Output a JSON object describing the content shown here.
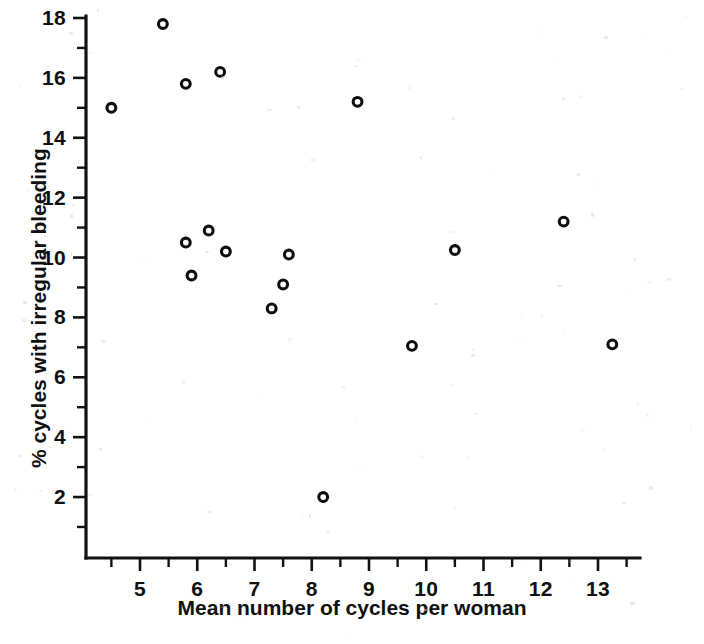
{
  "chart_data": {
    "type": "scatter",
    "title": "",
    "xlabel": "Mean number of cycles per woman",
    "ylabel": "% cycles with irregular bleeding",
    "xlim": [
      4.05,
      13.75
    ],
    "ylim": [
      0.55,
      18.4
    ],
    "xticks": [
      5,
      6,
      7,
      8,
      9,
      10,
      11,
      12,
      13
    ],
    "xtick_labels": [
      "5",
      "6",
      "7",
      "8",
      "9",
      "10",
      "11",
      "12",
      "13"
    ],
    "yticks": [
      2,
      4,
      6,
      8,
      10,
      12,
      14,
      16,
      18
    ],
    "ytick_labels": [
      "2",
      "4",
      "6",
      "8",
      "10",
      "12",
      "14",
      "16",
      "18"
    ],
    "x_minor_ticks": [
      4.5,
      5.5,
      6.5,
      7.5,
      8.5,
      9.5,
      10.5,
      11.5,
      12.5,
      13.5
    ],
    "y_minor_ticks": [
      1,
      3,
      5,
      7,
      9,
      11,
      13,
      15,
      17
    ],
    "grid": false,
    "legend": null,
    "marker": "open-circle",
    "marker_color": "#0d0d0d",
    "points": [
      {
        "x": 4.5,
        "y": 15.0
      },
      {
        "x": 5.4,
        "y": 17.8
      },
      {
        "x": 5.8,
        "y": 15.8
      },
      {
        "x": 6.4,
        "y": 16.2
      },
      {
        "x": 8.8,
        "y": 15.2
      },
      {
        "x": 5.8,
        "y": 10.5
      },
      {
        "x": 6.2,
        "y": 10.9
      },
      {
        "x": 6.5,
        "y": 10.2
      },
      {
        "x": 5.9,
        "y": 9.4
      },
      {
        "x": 7.6,
        "y": 10.1
      },
      {
        "x": 7.5,
        "y": 9.1
      },
      {
        "x": 7.3,
        "y": 8.3
      },
      {
        "x": 10.5,
        "y": 10.25
      },
      {
        "x": 12.4,
        "y": 11.2
      },
      {
        "x": 9.75,
        "y": 7.05
      },
      {
        "x": 13.25,
        "y": 7.1
      },
      {
        "x": 8.2,
        "y": 2.0
      }
    ]
  }
}
